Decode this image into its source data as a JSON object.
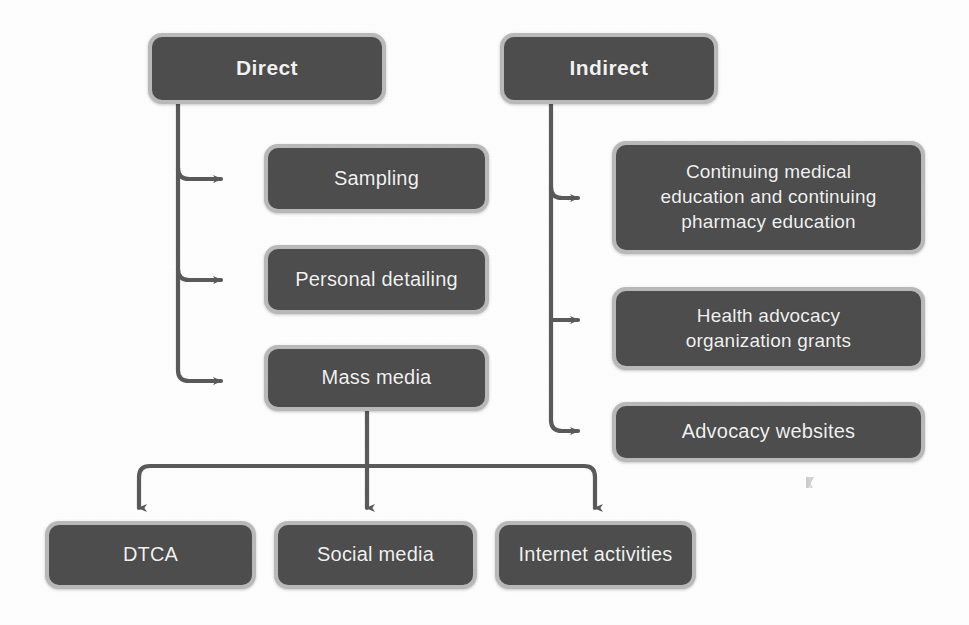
{
  "diagram": {
    "type": "flowchart",
    "colors": {
      "node_fill": "#4d4d4d",
      "node_border": "#b9b9b9",
      "node_text": "#f2f2f2",
      "connector": "#5a5a5a",
      "background": "#fdfdfd"
    },
    "roots": [
      {
        "id": "direct",
        "label": "Direct",
        "children": [
          "sampling",
          "personal-detailing",
          "mass-media"
        ]
      },
      {
        "id": "indirect",
        "label": "Indirect",
        "children": [
          "cme-cpe",
          "health-advocacy",
          "advocacy-websites"
        ]
      }
    ],
    "nodes": [
      {
        "id": "direct",
        "label": "Direct",
        "level": "root",
        "column": "left"
      },
      {
        "id": "indirect",
        "label": "Indirect",
        "level": "root",
        "column": "right"
      },
      {
        "id": "sampling",
        "label": "Sampling",
        "level": "branch",
        "column": "left"
      },
      {
        "id": "personal-detailing",
        "label": "Personal detailing",
        "level": "branch",
        "column": "left"
      },
      {
        "id": "mass-media",
        "label": "Mass media",
        "level": "branch",
        "column": "left"
      },
      {
        "id": "cme-cpe",
        "label": "Continuing medical education and continuing pharmacy education",
        "level": "branch",
        "column": "right"
      },
      {
        "id": "health-advocacy",
        "label": "Health advocacy organization grants",
        "level": "branch",
        "column": "right"
      },
      {
        "id": "advocacy-websites",
        "label": "Advocacy websites",
        "level": "branch",
        "column": "right"
      },
      {
        "id": "dtca",
        "label": "DTCA",
        "level": "leaf",
        "column": "bottom"
      },
      {
        "id": "social-media",
        "label": "Social media",
        "level": "leaf",
        "column": "bottom"
      },
      {
        "id": "internet-activities",
        "label": "Internet activities",
        "level": "leaf",
        "column": "bottom"
      }
    ],
    "edges": [
      {
        "from": "direct",
        "to": "sampling"
      },
      {
        "from": "direct",
        "to": "personal-detailing"
      },
      {
        "from": "direct",
        "to": "mass-media"
      },
      {
        "from": "indirect",
        "to": "cme-cpe"
      },
      {
        "from": "indirect",
        "to": "health-advocacy"
      },
      {
        "from": "indirect",
        "to": "advocacy-websites"
      },
      {
        "from": "mass-media",
        "to": "dtca"
      },
      {
        "from": "mass-media",
        "to": "social-media"
      },
      {
        "from": "mass-media",
        "to": "internet-activities"
      }
    ],
    "labels": {
      "direct": "Direct",
      "indirect": "Indirect",
      "sampling": "Sampling",
      "personal_detailing": "Personal detailing",
      "mass_media": "Mass media",
      "cme_cpe_line1": "Continuing medical",
      "cme_cpe_line2": "education and continuing",
      "cme_cpe_line3": "pharmacy education",
      "health_advocacy_line1": "Health advocacy",
      "health_advocacy_line2": "organization grants",
      "advocacy_websites": "Advocacy websites",
      "dtca": "DTCA",
      "social_media": "Social media",
      "internet_activities": "Internet activities"
    }
  }
}
